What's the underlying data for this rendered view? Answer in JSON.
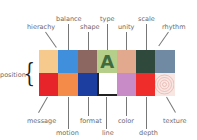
{
  "diagram": {
    "left_label": "position",
    "top_labels": [
      "hierachy",
      "balance",
      "shape",
      "type",
      "unity",
      "scale",
      "rhythm"
    ],
    "bottom_labels": [
      "message",
      "motion",
      "format",
      "line",
      "color",
      "depth",
      "texture"
    ],
    "top_row_colors": [
      "#f6c98c",
      "#3f8fdc",
      "#8c6661",
      "#b5cf8a",
      "#e2a98f",
      "#2f4a3d",
      "#6f8aa2"
    ],
    "bottom_row_colors": [
      "#e8242b",
      "#f58b48",
      "#1b3ea0",
      "#ffffff",
      "#c98bc8",
      "#ef2d2b",
      "#f7e6e2"
    ],
    "type_glyph": "A"
  }
}
